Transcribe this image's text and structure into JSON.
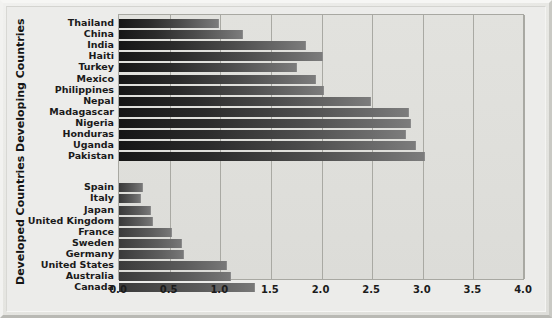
{
  "chart_data": {
    "type": "bar",
    "orientation": "horizontal",
    "title": "",
    "xlabel": "",
    "ylabel": "",
    "xlim": [
      0.0,
      4.0
    ],
    "xticks": [
      "0.0",
      "0.5",
      "1.0",
      "1.5",
      "2.0",
      "2.5",
      "3.0",
      "3.5",
      "4.0"
    ],
    "xtick_values": [
      0.0,
      0.5,
      1.0,
      1.5,
      2.0,
      2.5,
      3.0,
      3.5,
      4.0
    ],
    "grid": true,
    "legend": "none",
    "groups": [
      {
        "name": "Developing Countries",
        "categories": [
          "Thailand",
          "China",
          "India",
          "Haiti",
          "Turkey",
          "Mexico",
          "Philippines",
          "Nepal",
          "Madagascar",
          "Nigeria",
          "Honduras",
          "Uganda",
          "Pakistan"
        ],
        "values": [
          0.99,
          1.22,
          1.85,
          2.01,
          1.76,
          1.95,
          2.02,
          2.49,
          2.86,
          2.88,
          2.83,
          2.93,
          3.02
        ]
      },
      {
        "name": "Developed Countries",
        "categories": [
          "Spain",
          "Italy",
          "Japan",
          "United Kingdom",
          "France",
          "Sweden",
          "Germany",
          "United States",
          "Australia",
          "Canada"
        ],
        "values": [
          0.24,
          0.22,
          0.32,
          0.34,
          0.52,
          0.62,
          0.64,
          1.07,
          1.11,
          1.34
        ]
      }
    ]
  },
  "axis_titles": {
    "developing": "Developing Countries",
    "developed": "Developed Countries"
  }
}
